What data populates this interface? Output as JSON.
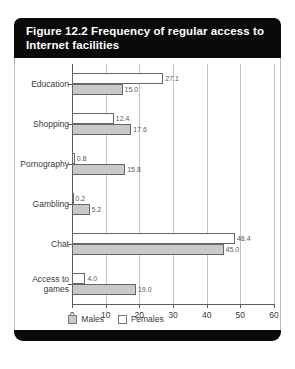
{
  "figure": {
    "title": "Figure 12.2 Frequency of regular access to Internet facilities"
  },
  "legend": {
    "position": "bottom-center",
    "items": [
      {
        "label": "Males",
        "swatch": "grey-filled-square",
        "color": "#c9c9c9"
      },
      {
        "label": "Females",
        "swatch": "white-square",
        "color": "#ffffff"
      }
    ]
  },
  "axis": {
    "ticks": [
      "0",
      "10",
      "20",
      "30",
      "40",
      "50",
      "60"
    ]
  },
  "chart_data": {
    "type": "bar",
    "orientation": "horizontal",
    "title": "Figure 12.2 Frequency of regular access to Internet facilities",
    "xlabel": "",
    "ylabel": "",
    "xlim": [
      0,
      60
    ],
    "xticks": [
      0,
      10,
      20,
      30,
      40,
      50,
      60
    ],
    "grid": true,
    "legend_position": "bottom-center",
    "categories": [
      "Education",
      "Shopping",
      "Pornography",
      "Gambling",
      "Chat",
      "Access to games"
    ],
    "series": [
      {
        "name": "Females",
        "color": "#ffffff",
        "values": [
          27.1,
          12.4,
          0.8,
          0.2,
          48.4,
          4.0
        ],
        "labels": [
          "27.1",
          "12.4",
          "0.8",
          "0.2",
          "48.4",
          "4.0"
        ]
      },
      {
        "name": "Males",
        "color": "#c9c9c9",
        "values": [
          15.0,
          17.6,
          15.8,
          5.2,
          45.0,
          19.0
        ],
        "labels": [
          "15.0",
          "17.6",
          "15.8",
          "5.2",
          "45.0",
          "19.0"
        ]
      }
    ]
  }
}
